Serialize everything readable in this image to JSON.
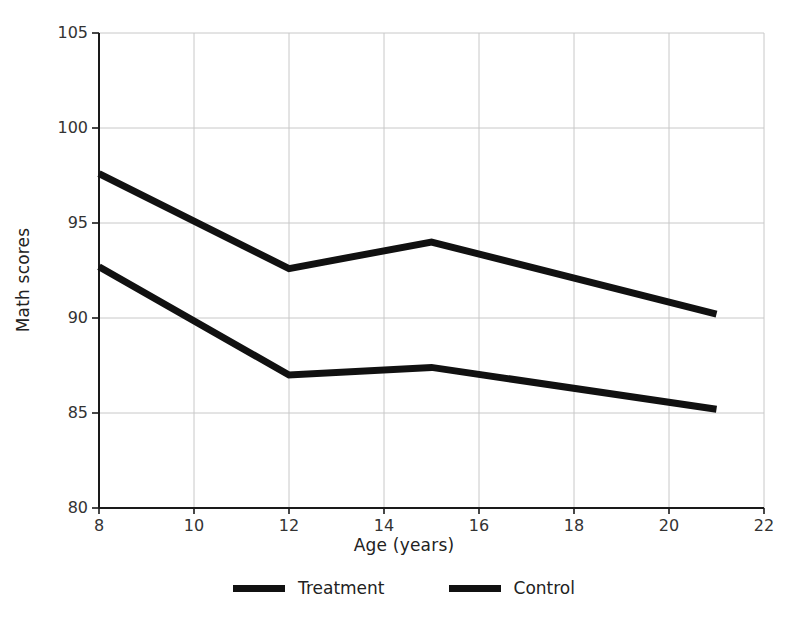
{
  "chart_data": {
    "type": "line",
    "title": "",
    "subtitle": "",
    "xlabel": "Age (years)",
    "ylabel": "Math scores",
    "xlim": [
      8,
      22
    ],
    "ylim": [
      80,
      105
    ],
    "xticks": [
      8,
      10,
      12,
      14,
      16,
      18,
      20,
      22
    ],
    "yticks": [
      80,
      85,
      90,
      95,
      100,
      105
    ],
    "grid": true,
    "grid_color": "#c8c8c8",
    "legend_position": "bottom",
    "series": [
      {
        "name": "Treatment",
        "color": "#111111",
        "x": [
          8,
          12,
          15,
          21
        ],
        "values": [
          97.6,
          92.6,
          94.0,
          90.2
        ]
      },
      {
        "name": "Control",
        "color": "#111111",
        "x": [
          8,
          12,
          15,
          21
        ],
        "values": [
          92.7,
          87.0,
          87.4,
          85.2
        ]
      }
    ]
  },
  "axes": {
    "x_title": "Age (years)",
    "y_title": "Math scores",
    "x_tick_labels": [
      "8",
      "10",
      "12",
      "14",
      "16",
      "18",
      "20",
      "22"
    ],
    "y_tick_labels": [
      "80",
      "85",
      "90",
      "95",
      "100",
      "105"
    ]
  },
  "legend": {
    "items": [
      {
        "label": "Treatment"
      },
      {
        "label": "Control"
      }
    ]
  }
}
